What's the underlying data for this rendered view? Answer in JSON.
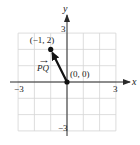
{
  "diagram": {
    "type": "coordinate-vector",
    "axes": {
      "x_label": "x",
      "y_label": "y",
      "x_range": [
        -3,
        3
      ],
      "y_range": [
        -3,
        3
      ],
      "x_ticks": [
        {
          "value": -3,
          "label": "−3"
        },
        {
          "value": 3,
          "label": "3"
        }
      ],
      "y_ticks": [
        {
          "value": 3,
          "label": "3"
        },
        {
          "value": -3,
          "label": "−3"
        }
      ],
      "grid": true
    },
    "points": [
      {
        "id": "P",
        "x": 0,
        "y": 0,
        "label": "(0, 0)"
      },
      {
        "id": "Q",
        "x": -1,
        "y": 2,
        "label": "(−1, 2)"
      }
    ],
    "vector": {
      "from": "P",
      "to": "Q",
      "label": "PQ",
      "label_arrow": "→"
    },
    "colors": {
      "grid": "#d4d4d4",
      "axis": "#2a2a2a",
      "vector": "#111111"
    }
  }
}
